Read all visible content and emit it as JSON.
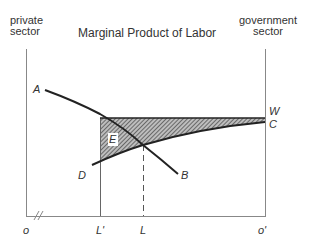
{
  "title": "Marginal Product of Labor",
  "left_axis_label": [
    "private",
    "sector"
  ],
  "right_axis_label": [
    "government",
    "sector"
  ],
  "curve_labels": {
    "A": "A",
    "B": "B",
    "C": "C",
    "D": "D",
    "W": "W",
    "E": "E"
  },
  "x_axis_labels": {
    "origin": "o",
    "L_prime": "L'",
    "L": "L",
    "origin_prime": "o'"
  },
  "colors": {
    "axis": "#888888",
    "curve": "#222222",
    "hatch": "#555555"
  }
}
